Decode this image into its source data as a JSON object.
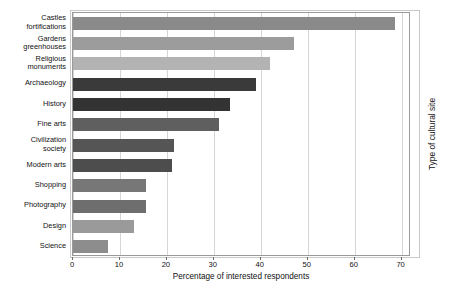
{
  "chart_data": {
    "type": "bar",
    "orientation": "horizontal",
    "title": "",
    "xlabel": "Percentage of interested respondents",
    "ylabel": "Type of cultural site",
    "xlim": [
      0,
      72
    ],
    "xticks": [
      0,
      10,
      20,
      30,
      40,
      50,
      60,
      70
    ],
    "xtick_labels": [
      "0",
      "10",
      "20",
      "30",
      "40",
      "50",
      "60",
      "70"
    ],
    "grid": "vertical",
    "legend": "none",
    "categories": [
      "Castles\nfortifications",
      "Gardens\ngreenhouses",
      "Religious\nmonuments",
      "Archaeology",
      "History",
      "Fine arts",
      "Civilization\nsociety",
      "Modern arts",
      "Shopping",
      "Photography",
      "Design",
      "Science"
    ],
    "values": [
      68.5,
      47,
      42,
      39,
      33.5,
      31,
      21.5,
      21,
      15.5,
      15.5,
      13,
      7.5
    ],
    "bar_colors": [
      "#8a8a8a",
      "#9c9c9c",
      "#b3b3b3",
      "#3a3a3a",
      "#333333",
      "#5f5f5f",
      "#555555",
      "#4d4d4d",
      "#777777",
      "#6e6e6e",
      "#9a9a9a",
      "#8d8d8d"
    ]
  },
  "colors": {
    "background": "#ffffff",
    "plot_background": "#ffffff",
    "gridline": "#d6d6d6",
    "axis": "#9a9a9a",
    "text": "#111111"
  }
}
